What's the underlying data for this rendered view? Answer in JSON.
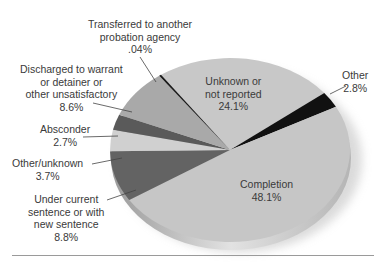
{
  "chart_data": {
    "type": "pie",
    "title": "",
    "style": "3d-oblique",
    "slices": [
      {
        "label": "Unknown or not reported",
        "value": 24.1,
        "display": "24.1%",
        "color": "#c8c8c8"
      },
      {
        "label": "Other",
        "value": 2.8,
        "display": "2.8%",
        "color": "#111111"
      },
      {
        "label": "Completion",
        "value": 48.1,
        "display": "48.1%",
        "color": "#c6c6c6"
      },
      {
        "label": "Under current sentence or with new sentence",
        "value": 8.8,
        "display": "8.8%",
        "color": "#636363"
      },
      {
        "label": "Other/unknown",
        "value": 3.7,
        "display": "3.7%",
        "color": "#d0d0d0"
      },
      {
        "label": "Absconder",
        "value": 2.7,
        "display": "2.7%",
        "color": "#5a5a5a"
      },
      {
        "label": "Discharged to warrant or detainer or other unsatisfactory",
        "value": 8.6,
        "display": "8.6%",
        "color": "#a9a9a9"
      },
      {
        "label": "Transferred to another probation agency",
        "value": 0.04,
        "display": ".04%",
        "color": "#1a1a1a"
      }
    ]
  },
  "labels": {
    "transferred": {
      "lines": [
        "Transferred to another",
        "probation agency",
        ".04%"
      ]
    },
    "discharged": {
      "lines": [
        "Discharged to warrant",
        "or detainer or",
        "other unsatisfactory",
        "8.6%"
      ]
    },
    "absconder": {
      "lines": [
        "Absconder",
        "2.7%"
      ]
    },
    "other_unknown": {
      "lines": [
        "Other/unknown",
        "3.7%"
      ]
    },
    "under_current": {
      "lines": [
        "Under current",
        "sentence or with",
        "new sentence",
        "8.8%"
      ]
    },
    "unknown": {
      "lines": [
        "Unknown or",
        "not reported",
        "24.1%"
      ]
    },
    "other": {
      "lines": [
        "Other",
        "2.8%"
      ]
    },
    "completion": {
      "lines": [
        "Completion",
        "48.1%"
      ]
    }
  }
}
